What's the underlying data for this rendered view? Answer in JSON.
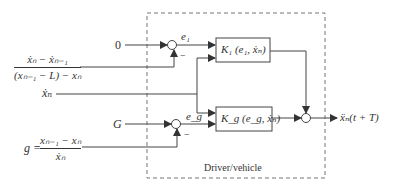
{
  "diagram": {
    "boundary_label": "Driver/vehicle",
    "inputs": {
      "zero_reference": "0",
      "gap_reference": "G",
      "speed_input": "ẋₙ",
      "fraction1_numerator": "ẋₙ − ẋₙ₋₁",
      "fraction1_denominator": "(xₙ₋₁ − L) − xₙ",
      "g_prefix": "g =",
      "fraction2_numerator": "xₙ₋₁ − xₙ",
      "fraction2_denominator": "ẋₙ"
    },
    "signals": {
      "error1": "e₁",
      "error_g": "e_g",
      "minus1": "−",
      "minus2": "−"
    },
    "blocks": {
      "k1": "K₁ (e₁, ẋₙ)",
      "kg": "K_g (e_g, ẋₙ)"
    },
    "output": "ẍₙ(t + T)",
    "colors": {
      "line": "#444444",
      "text": "#333333",
      "dashed": "#777777"
    }
  }
}
